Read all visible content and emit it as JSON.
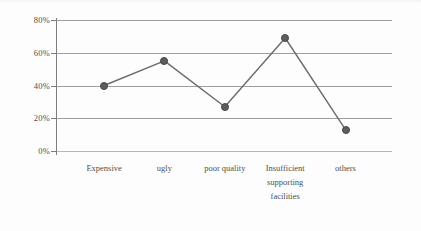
{
  "chart_data": {
    "type": "line",
    "title": "",
    "xlabel": "",
    "ylabel": "",
    "categories": [
      "Expensive",
      "ugly",
      "poor quality",
      "Insufficient supporting facilities",
      "others"
    ],
    "category_lines": [
      [
        "Expensive"
      ],
      [
        "ugly"
      ],
      [
        "poor quality"
      ],
      [
        "Insufficient",
        "supporting",
        "facilities"
      ],
      [
        "others"
      ]
    ],
    "values": [
      40,
      55,
      27,
      69,
      13
    ],
    "value_labels": [
      "40%",
      "55%",
      "27%",
      "69%",
      "13%"
    ],
    "ylim": [
      0,
      80
    ],
    "yticks": [
      0,
      20,
      40,
      60,
      80
    ],
    "ytick_labels": [
      "0%",
      "20%",
      "40%",
      "60%",
      "80%"
    ],
    "grid": true,
    "legend": false,
    "marker": "circle",
    "colors": {
      "line": "#6b6b6b",
      "marker": "#5d5d5d",
      "marker_edge": "#474747",
      "grid": "#8d8d8d",
      "axis": "#7e7e7e",
      "text": "#4f4f4f",
      "background": "#fdfdfd"
    }
  }
}
